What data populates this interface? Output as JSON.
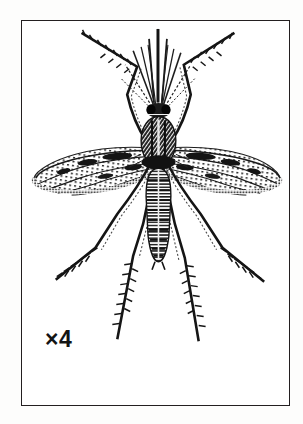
{
  "plate": {
    "background_color": "#fdfdfc",
    "frame": {
      "border_color": "#231f20",
      "fill_color": "#ffffff",
      "x": 21,
      "y": 20,
      "width": 269,
      "height": 386
    },
    "caption": {
      "text": "×4",
      "color": "#141414"
    },
    "illustration": {
      "subject": "mosquito",
      "style": "black-and-white engraved line drawing",
      "ink_color": "#1a1a1a",
      "orientation": "dorsal view, head up, wings spread laterally",
      "parts": [
        {
          "name": "proboscis",
          "label": "proboscis"
        },
        {
          "name": "antennae",
          "label": "plumose antennae"
        },
        {
          "name": "palps",
          "label": "maxillary palps"
        },
        {
          "name": "head",
          "label": "head with compound eyes"
        },
        {
          "name": "thorax",
          "label": "scaled thorax"
        },
        {
          "name": "abdomen",
          "label": "banded segmented abdomen"
        },
        {
          "name": "left-wing",
          "label": "left wing with dark scale patches"
        },
        {
          "name": "right-wing",
          "label": "right wing with dark scale patches"
        },
        {
          "name": "foreleg-left",
          "label": "left foreleg"
        },
        {
          "name": "foreleg-right",
          "label": "right foreleg"
        },
        {
          "name": "midleg-left",
          "label": "left midleg"
        },
        {
          "name": "midleg-right",
          "label": "right midleg"
        },
        {
          "name": "hindleg-left",
          "label": "left hindleg"
        },
        {
          "name": "hindleg-right",
          "label": "right hindleg"
        }
      ]
    }
  }
}
